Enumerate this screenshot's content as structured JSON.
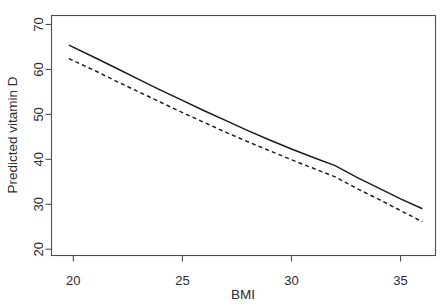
{
  "chart_data": {
    "type": "line",
    "title": "",
    "subtitle": "",
    "xlabel": "BMI",
    "ylabel": "Predicted vitamin D",
    "xlim": [
      19.0,
      36.6
    ],
    "ylim": [
      18.6,
      72.0
    ],
    "xticks": [
      20,
      25,
      30,
      35
    ],
    "yticks": [
      20,
      30,
      40,
      50,
      60,
      70
    ],
    "xtick_labels": [
      "20",
      "25",
      "30",
      "35"
    ],
    "ytick_labels": [
      "20",
      "30",
      "40",
      "50",
      "60",
      "70"
    ],
    "grid": false,
    "legend": null,
    "legend_position": "none",
    "annotations": [],
    "frame": "box",
    "x": [
      19.8,
      21.0,
      22.0,
      23.0,
      24.0,
      25.0,
      26.0,
      27.0,
      28.0,
      29.0,
      30.0,
      31.0,
      32.0,
      33.0,
      34.0,
      35.0,
      36.0
    ],
    "series": [
      {
        "name": "solid-curve",
        "style": "solid",
        "color": "#1c1c1c",
        "values": [
          65.4,
          62.6,
          60.2,
          57.8,
          55.4,
          53.1,
          50.8,
          48.6,
          46.4,
          44.3,
          42.3,
          40.4,
          38.6,
          36.0,
          33.6,
          31.2,
          29.0
        ]
      },
      {
        "name": "dashed-curve",
        "style": "dashed",
        "color": "#1c1c1c",
        "values": [
          62.4,
          59.7,
          57.3,
          55.0,
          52.7,
          50.4,
          48.2,
          46.0,
          43.9,
          41.9,
          39.9,
          38.0,
          36.1,
          33.5,
          31.1,
          28.6,
          26.1
        ]
      }
    ]
  },
  "axis": {
    "x_title": "BMI",
    "y_title": "Predicted vitamin D"
  }
}
